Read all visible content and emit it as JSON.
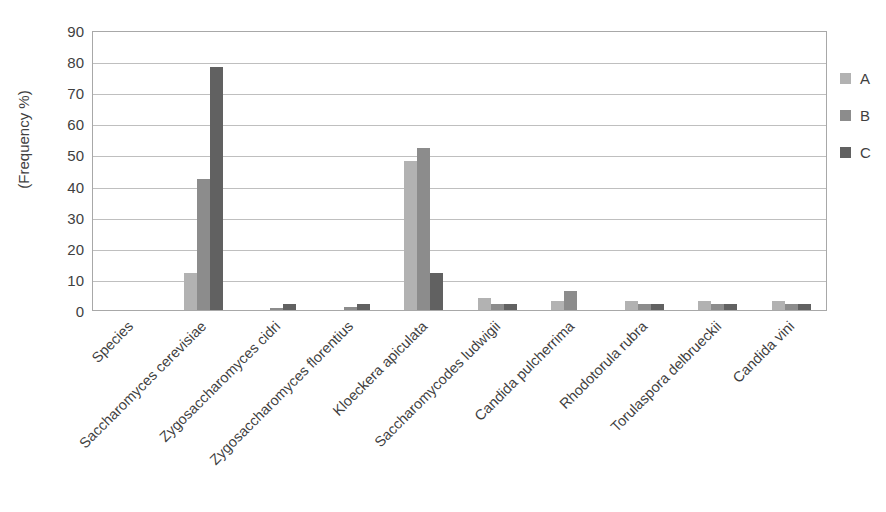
{
  "chart_data": {
    "type": "bar",
    "title": "",
    "xlabel": "",
    "ylabel": "(Frequency %)",
    "ylim": [
      0,
      90
    ],
    "ytick_step": 10,
    "yticks": [
      90,
      80,
      70,
      60,
      50,
      40,
      30,
      20,
      10,
      0
    ],
    "grid": true,
    "legend_position": "right",
    "categories": [
      "Species",
      "Saccharomyces cerevisiae",
      "Zygosaccharomyces cidri",
      "Zygosaccharomyces florentius",
      "Kloeckera apiculata",
      "Saccharomycodes ludwigii",
      "Candida pulcherrima",
      "Rhodotorula rubra",
      "Torulaspora delbrueckii",
      "Candida vini"
    ],
    "series": [
      {
        "name": "A",
        "color": "#b2b2b2",
        "values": [
          0,
          12,
          0,
          0,
          48,
          4,
          3,
          3,
          3,
          3
        ]
      },
      {
        "name": "B",
        "color": "#8c8c8c",
        "values": [
          0,
          42,
          0.5,
          1,
          52,
          2,
          6,
          2,
          2,
          2
        ]
      },
      {
        "name": "C",
        "color": "#616161",
        "values": [
          0,
          78,
          2,
          2,
          12,
          2,
          0,
          2,
          2,
          2
        ]
      }
    ]
  },
  "legend": {
    "entries": [
      {
        "label": "A",
        "color": "#b2b2b2"
      },
      {
        "label": "B",
        "color": "#8c8c8c"
      },
      {
        "label": "C",
        "color": "#616161"
      }
    ]
  }
}
